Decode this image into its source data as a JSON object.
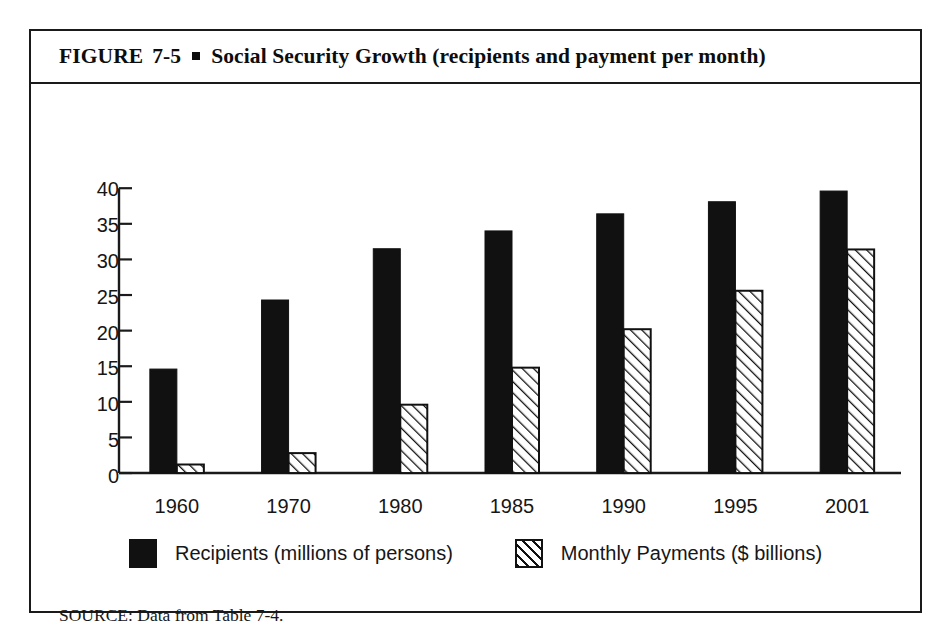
{
  "figure": {
    "label": "FIGURE",
    "number": "7-5",
    "bullet": "square-bullet",
    "title": "Social Security Growth (recipients and payment per month)",
    "source": "SOURCE: Data from Table 7-4."
  },
  "chart_data": {
    "type": "bar",
    "title": "Social Security Growth (recipients and payment per month)",
    "categories": [
      "1960",
      "1970",
      "1980",
      "1985",
      "1990",
      "1995",
      "2001"
    ],
    "series": [
      {
        "name": "Recipients (millions of persons)",
        "fill": "solid-black",
        "color": "#111111",
        "values": [
          14.6,
          24.3,
          31.5,
          34.0,
          36.4,
          38.1,
          39.6
        ]
      },
      {
        "name": "Monthly Payments ($ billions)",
        "fill": "diagonal-hatch",
        "color": "#ffffff",
        "values": [
          1.2,
          2.8,
          9.6,
          14.8,
          20.2,
          25.6,
          31.4
        ]
      }
    ],
    "xlabel": "",
    "ylabel": "",
    "ylim": [
      0,
      40
    ],
    "yticks": [
      0,
      5,
      10,
      15,
      20,
      25,
      30,
      35,
      40
    ],
    "grid": false,
    "legend_position": "bottom"
  }
}
